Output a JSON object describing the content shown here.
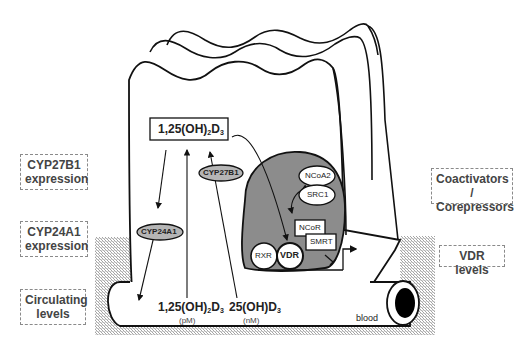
{
  "diagram": {
    "side_labels_left": [
      {
        "text_line1": "CYP27B1",
        "text_line2": "expression"
      },
      {
        "text_line1": "CYP24A1",
        "text_line2": "expression"
      },
      {
        "text_line1": "Circulating",
        "text_line2": "levels"
      }
    ],
    "side_labels_right": [
      {
        "text_line1": "Coactivators /",
        "text_line2": "Corepressors"
      },
      {
        "text_line1": "VDR levels",
        "text_line2": ""
      }
    ],
    "cell": {
      "active_metabolite": {
        "prefix": "1,25(OH)",
        "sub": "2",
        "suffix": "D",
        "sub2": "3"
      },
      "enzymes": {
        "activating": "CYP27B1",
        "degrading": "CYP24A1"
      }
    },
    "nucleus": {
      "coactivators": [
        "NCoA2",
        "SRC1"
      ],
      "corepressors": [
        "NCoR",
        "SMRT"
      ],
      "receptors": [
        "RXR",
        "VDR"
      ]
    },
    "blood": {
      "label": "blood",
      "metabolites": [
        {
          "prefix": "1,25(OH)",
          "sub": "2",
          "suffix": "D",
          "sub2": "3",
          "unit": "(pM)"
        },
        {
          "prefix": "25(OH)",
          "sub": "",
          "suffix": "D",
          "sub2": "3",
          "unit": "(nM)"
        }
      ]
    },
    "colors": {
      "outline": "#111111",
      "nucleus_fill": "#8c8c8c",
      "enzyme_fill": "#b5b5b5",
      "hatch": "#9a9a9a"
    }
  }
}
